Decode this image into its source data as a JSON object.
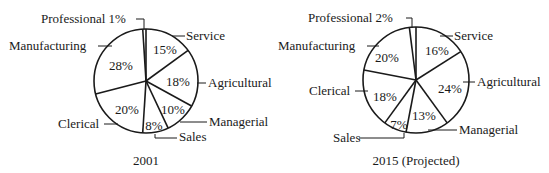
{
  "chart_data": [
    {
      "type": "pie",
      "title": "2001",
      "start_angle_deg": 0,
      "direction": "clockwise",
      "categories": [
        "Service",
        "Agricultural",
        "Managerial",
        "Sales",
        "Clerical",
        "Manufacturing",
        "Professional"
      ],
      "values": [
        15,
        18,
        10,
        8,
        20,
        28,
        1
      ],
      "value_labels": [
        "15%",
        "18%",
        "10%",
        "8%",
        "20%",
        "28%",
        "1%"
      ],
      "legend": "none (callout labels)"
    },
    {
      "type": "pie",
      "title": "2015 (Projected)",
      "start_angle_deg": 0,
      "direction": "clockwise",
      "categories": [
        "Service",
        "Agricultural",
        "Managerial",
        "Sales",
        "Clerical",
        "Manufacturing",
        "Professional"
      ],
      "values": [
        16,
        24,
        13,
        7,
        18,
        20,
        2
      ],
      "value_labels": [
        "16%",
        "24%",
        "13%",
        "7%",
        "18%",
        "20%",
        "2%"
      ],
      "legend": "none (callout labels)"
    }
  ],
  "charts": {
    "left": {
      "caption": "2001",
      "labels": {
        "professional": "Professional 1%",
        "manufacturing": "Manufacturing",
        "service": "Service",
        "agricultural": "Agricultural",
        "managerial": "Managerial",
        "sales": "Sales",
        "clerical": "Clerical"
      },
      "pcts": {
        "service": "15%",
        "agricultural": "18%",
        "managerial": "10%",
        "sales": "8%",
        "clerical": "20%",
        "manufacturing": "28%"
      }
    },
    "right": {
      "caption": "2015 (Projected)",
      "labels": {
        "professional": "Professional 2%",
        "manufacturing": "Manufacturing",
        "service": "Service",
        "agricultural": "Agricultural",
        "managerial": "Managerial",
        "sales": "Sales",
        "clerical": "Clerical"
      },
      "pcts": {
        "service": "16%",
        "agricultural": "24%",
        "managerial": "13%",
        "sales": "7%",
        "clerical": "18%",
        "manufacturing": "20%"
      }
    }
  },
  "colors": {
    "ink": "#1a1a1a",
    "background": "#ffffff"
  }
}
